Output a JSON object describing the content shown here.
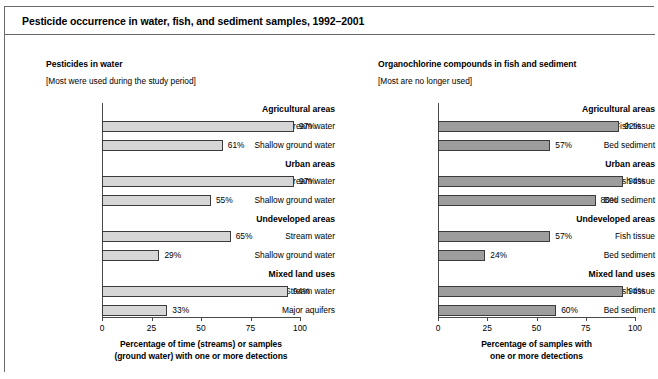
{
  "figure": {
    "title": "Pesticide occurrence in water, fish, and sediment samples, 1992–2001"
  },
  "chart_data": [
    {
      "type": "bar",
      "orientation": "horizontal",
      "panel": "left",
      "title": "Pesticides in water",
      "subtitle": "[Most were used during the study period]",
      "xlabel": "Percentage of time (streams) or samples (ground water) with one or more detections",
      "xlabel_line1": "Percentage of time (streams) or samples",
      "xlabel_line2": "(ground water) with one or more detections",
      "ylabel": "",
      "xlim": [
        0,
        100
      ],
      "xticks": [
        0,
        25,
        50,
        75,
        100
      ],
      "xtick_labels": [
        "0",
        "25",
        "50",
        "75",
        "100"
      ],
      "grid": false,
      "bar_color": "#d6d6d6",
      "bar_edge_color": "#3b3b3b",
      "groups": [
        {
          "label": "Agricultural areas",
          "rows": [
            {
              "label": "Stream water",
              "value": 97,
              "value_label": "97%"
            },
            {
              "label": "Shallow ground water",
              "value": 61,
              "value_label": "61%"
            }
          ]
        },
        {
          "label": "Urban areas",
          "rows": [
            {
              "label": "Stream water",
              "value": 97,
              "value_label": "97%"
            },
            {
              "label": "Shallow ground water",
              "value": 55,
              "value_label": "55%"
            }
          ]
        },
        {
          "label": "Undeveloped areas",
          "rows": [
            {
              "label": "Stream water",
              "value": 65,
              "value_label": "65%"
            },
            {
              "label": "Shallow ground water",
              "value": 29,
              "value_label": "29%"
            }
          ]
        },
        {
          "label": "Mixed land uses",
          "rows": [
            {
              "label": "Stream water",
              "value": 94,
              "value_label": "94%"
            },
            {
              "label": "Major aquifers",
              "value": 33,
              "value_label": "33%"
            }
          ]
        }
      ]
    },
    {
      "type": "bar",
      "orientation": "horizontal",
      "panel": "right",
      "title": "Organochlorine compounds in fish and sediment",
      "subtitle": "[Most are no longer used]",
      "xlabel": "Percentage of samples with one or more detections",
      "xlabel_line1": "Percentage of samples with",
      "xlabel_line2": "one or more detections",
      "ylabel": "",
      "xlim": [
        0,
        100
      ],
      "xticks": [
        0,
        25,
        50,
        75,
        100
      ],
      "xtick_labels": [
        "0",
        "25",
        "50",
        "75",
        "100"
      ],
      "grid": false,
      "bar_color": "#9d9d9d",
      "bar_edge_color": "#3b3b3b",
      "groups": [
        {
          "label": "Agricultural areas",
          "rows": [
            {
              "label": "Fish tissue",
              "value": 92,
              "value_label": "92%"
            },
            {
              "label": "Bed sediment",
              "value": 57,
              "value_label": "57%"
            }
          ]
        },
        {
          "label": "Urban areas",
          "rows": [
            {
              "label": "Fish tissue",
              "value": 94,
              "value_label": "94%"
            },
            {
              "label": "Bed sediment",
              "value": 80,
              "value_label": "80%"
            }
          ]
        },
        {
          "label": "Undeveloped areas",
          "rows": [
            {
              "label": "Fish tissue",
              "value": 57,
              "value_label": "57%"
            },
            {
              "label": "Bed sediment",
              "value": 24,
              "value_label": "24%"
            }
          ]
        },
        {
          "label": "Mixed land uses",
          "rows": [
            {
              "label": "Fish tissue",
              "value": 94,
              "value_label": "94%"
            },
            {
              "label": "Bed sediment",
              "value": 60,
              "value_label": "60%"
            }
          ]
        }
      ]
    }
  ],
  "caption": ""
}
